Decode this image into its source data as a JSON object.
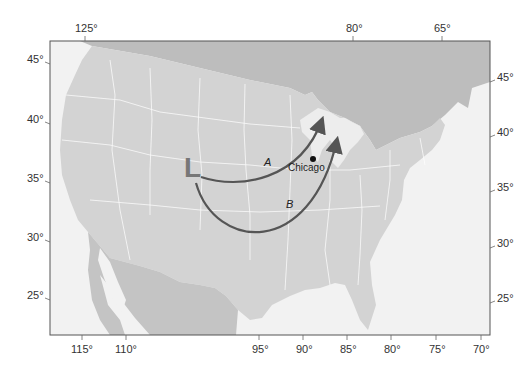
{
  "map": {
    "frame": {
      "left": 50,
      "top": 41,
      "right": 490,
      "bottom": 335
    },
    "colors": {
      "water": "#f2f2f2",
      "us_land": "#d3d3d3",
      "canada_land": "#bdbdbd",
      "mexico_land": "#c4c4c4",
      "borders": "#ffffff",
      "frame": "#555555",
      "arrow": "#555555",
      "low": "#777777"
    },
    "top_lon_labels": [
      {
        "text": "125°",
        "x": 85,
        "y": 26
      },
      {
        "text": "80°",
        "x": 347,
        "y": 26
      },
      {
        "text": "65°",
        "x": 435,
        "y": 26
      }
    ],
    "bottom_lon_labels": [
      {
        "text": "115°",
        "x": 73,
        "y": 152
      },
      {
        "text": "110°",
        "x": 116,
        "y": 152
      },
      {
        "text": "95°",
        "x": 252,
        "y": 152
      },
      {
        "text": "90°",
        "x": 294,
        "y": 152
      },
      {
        "text": "85°",
        "x": 338,
        "y": 152
      },
      {
        "text": "80°",
        "x": 382,
        "y": 152
      },
      {
        "text": "75°",
        "x": 426,
        "y": 152
      },
      {
        "text": "70°",
        "x": 471,
        "y": 152
      }
    ],
    "left_lat_labels": [
      {
        "text": "45°",
        "y": 59
      },
      {
        "text": "40°",
        "y": 119
      },
      {
        "text": "35°",
        "y": 178
      },
      {
        "text": "30°",
        "y": 237
      },
      {
        "text": "25°",
        "y": 295
      }
    ],
    "right_lat_labels": [
      {
        "text": "45°",
        "y": 77
      },
      {
        "text": "40°",
        "y": 132
      },
      {
        "text": "35°",
        "y": 187
      },
      {
        "text": "30°",
        "y": 243
      },
      {
        "text": "25°",
        "y": 298
      }
    ],
    "low_pressure": {
      "symbol": "L",
      "x": 186,
      "y": 157
    },
    "city": {
      "name": "Chicago",
      "dot_x": 313,
      "dot_y": 159,
      "label_x": 288,
      "label_y": 163
    },
    "tracks": [
      {
        "label": "A",
        "label_x": 264,
        "label_y": 159
      },
      {
        "label": "B",
        "label_x": 286,
        "label_y": 201
      }
    ]
  }
}
